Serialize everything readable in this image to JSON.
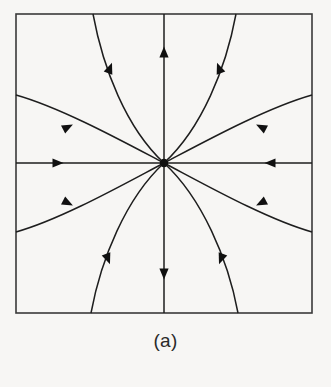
{
  "figure": {
    "caption": "(a)",
    "background_color": "#f7f6f4",
    "line_color": "#1e1e1e",
    "frame_color": "#3a3a3a"
  },
  "chart_data": {
    "type": "scatter",
    "subtitle": "(a)",
    "xlabel": "",
    "ylabel": "",
    "xlim": [
      -1,
      1
    ],
    "ylim": [
      -1,
      1
    ],
    "grid": false,
    "legend": null,
    "plot_box": {
      "x": 16,
      "y": 14,
      "width": 296,
      "height": 299
    },
    "fixed_point": {
      "name": "stable-node",
      "x": 164,
      "y": 163,
      "radius": 4.2,
      "stability": "stable",
      "flow_direction": "inward"
    },
    "annotations": [
      {
        "text": "(a)",
        "x": 165,
        "y": 345
      }
    ],
    "trajectories": [
      {
        "name": "axis-horizontal-left",
        "kind": "straight",
        "path": "M 16 163 L 164 163",
        "arrows": [
          {
            "x": 58,
            "y": 163,
            "angle": 0
          }
        ]
      },
      {
        "name": "axis-horizontal-right",
        "kind": "straight",
        "path": "M 312 163 L 164 163",
        "arrows": [
          {
            "x": 270,
            "y": 163,
            "angle": 180
          }
        ]
      },
      {
        "name": "axis-vertical-top",
        "kind": "straight",
        "path": "M 164 14 L 164 163",
        "arrows": [
          {
            "x": 164,
            "y": 52,
            "angle": 90
          }
        ]
      },
      {
        "name": "axis-vertical-bottom",
        "kind": "straight",
        "path": "M 164 313 L 164 163",
        "arrows": [
          {
            "x": 164,
            "y": 274,
            "angle": 270
          }
        ]
      },
      {
        "name": "curve-upper-left-steep",
        "kind": "curved",
        "path": "M 93 14 C 103 68, 126 128, 164 163",
        "arrows": [
          {
            "x": 110,
            "y": 68,
            "angle": 69
          }
        ]
      },
      {
        "name": "curve-upper-left-shallow",
        "kind": "curved",
        "path": "M 16 95 C 62 108, 124 142, 164 163",
        "arrows": [
          {
            "x": 68,
            "y": 127,
            "angle": 27
          }
        ]
      },
      {
        "name": "curve-upper-right-steep",
        "kind": "curved",
        "path": "M 236 14 C 226 68, 202 128, 164 163",
        "arrows": [
          {
            "x": 219,
            "y": 68,
            "angle": 111
          }
        ]
      },
      {
        "name": "curve-upper-right-shallow",
        "kind": "curved",
        "path": "M 312 95 C 266 108, 204 142, 164 163",
        "arrows": [
          {
            "x": 261,
            "y": 127,
            "angle": 153
          }
        ]
      },
      {
        "name": "curve-lower-left-steep",
        "kind": "curved",
        "path": "M 91 313 C 101 259, 126 198, 164 163",
        "arrows": [
          {
            "x": 108,
            "y": 259,
            "angle": -69
          }
        ]
      },
      {
        "name": "curve-lower-left-shallow",
        "kind": "curved",
        "path": "M 16 232 C 62 219, 124 184, 164 163",
        "arrows": [
          {
            "x": 68,
            "y": 203,
            "angle": -27
          }
        ]
      },
      {
        "name": "curve-lower-right-steep",
        "kind": "curved",
        "path": "M 238 313 C 228 259, 202 198, 164 163",
        "arrows": [
          {
            "x": 221,
            "y": 259,
            "angle": -111
          }
        ]
      },
      {
        "name": "curve-lower-right-shallow",
        "kind": "curved",
        "path": "M 312 232 C 266 219, 204 184, 164 163",
        "arrows": [
          {
            "x": 261,
            "y": 203,
            "angle": -153
          }
        ]
      }
    ]
  }
}
